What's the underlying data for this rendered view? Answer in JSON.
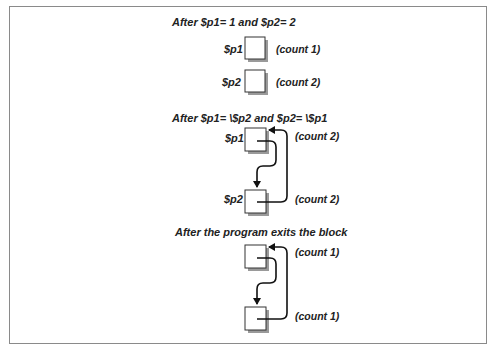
{
  "diagram": {
    "panels": [
      {
        "title": "After $p1= 1 and $p2= 2",
        "boxes": [
          {
            "label": "$p1",
            "count": "(count 1)"
          },
          {
            "label": "$p2",
            "count": "(count 2)"
          }
        ],
        "arrows": []
      },
      {
        "title": "After $p1= \\$p2 and $p2= \\$p1",
        "boxes": [
          {
            "label": "$p1",
            "count": "(count 2)"
          },
          {
            "label": "$p2",
            "count": "(count 2)"
          }
        ],
        "arrows": [
          "$p1 -> $p2",
          "$p2 -> $p1"
        ]
      },
      {
        "title": "After the program exits the block",
        "boxes": [
          {
            "label": "",
            "count": "(count 1)"
          },
          {
            "label": "",
            "count": "(count 1)"
          }
        ],
        "arrows": [
          "box1 -> box2",
          "box2 -> box1"
        ]
      }
    ]
  }
}
